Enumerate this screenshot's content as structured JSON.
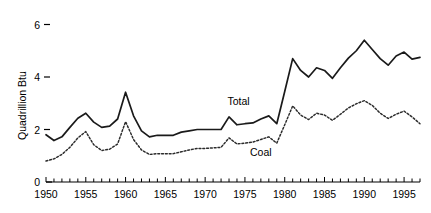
{
  "chart_data": {
    "type": "line",
    "title": "",
    "xlabel": "",
    "ylabel": "Quadrillion Btu",
    "xlim": [
      1950,
      1997
    ],
    "ylim": [
      0,
      6.4
    ],
    "grid": false,
    "legend": "inline-labels",
    "y_ticks": [
      0,
      2,
      4,
      6
    ],
    "y_tick_labels": [
      "0",
      "2",
      "4",
      "6"
    ],
    "x_ticks": [
      1950,
      1951,
      1952,
      1953,
      1954,
      1955,
      1956,
      1957,
      1958,
      1959,
      1960,
      1961,
      1962,
      1963,
      1964,
      1965,
      1966,
      1967,
      1968,
      1969,
      1970,
      1971,
      1972,
      1973,
      1974,
      1975,
      1976,
      1977,
      1978,
      1979,
      1980,
      1981,
      1982,
      1983,
      1984,
      1985,
      1986,
      1987,
      1988,
      1989,
      1990,
      1991,
      1992,
      1993,
      1994,
      1995,
      1996,
      1997
    ],
    "x_tick_labels": [
      "1950",
      "1955",
      "1960",
      "1965",
      "1970",
      "1975",
      "1980",
      "1985",
      "1990",
      "1995"
    ],
    "x_labeled_ticks": [
      1950,
      1955,
      1960,
      1965,
      1970,
      1975,
      1980,
      1985,
      1990,
      1995
    ],
    "x": [
      1950,
      1951,
      1952,
      1953,
      1954,
      1955,
      1956,
      1957,
      1958,
      1959,
      1960,
      1961,
      1962,
      1963,
      1964,
      1965,
      1966,
      1967,
      1968,
      1969,
      1970,
      1971,
      1972,
      1973,
      1974,
      1975,
      1976,
      1977,
      1978,
      1979,
      1980,
      1981,
      1982,
      1983,
      1984,
      1985,
      1986,
      1987,
      1988,
      1989,
      1990,
      1991,
      1992,
      1993,
      1994,
      1995,
      1996,
      1997
    ],
    "series": [
      {
        "name": "Total",
        "style": "solid",
        "color": "#1a1a1a",
        "label_year": 1974.2,
        "label_value": 2.95,
        "values": [
          1.8,
          1.58,
          1.72,
          2.08,
          2.43,
          2.62,
          2.28,
          2.08,
          2.13,
          2.4,
          3.42,
          2.52,
          1.95,
          1.72,
          1.78,
          1.78,
          1.78,
          1.9,
          1.95,
          2.0,
          2.0,
          2.0,
          2.0,
          2.48,
          2.18,
          2.22,
          2.25,
          2.4,
          2.52,
          2.22,
          3.45,
          4.7,
          4.25,
          4.0,
          4.35,
          4.25,
          3.95,
          4.35,
          4.72,
          5.0,
          5.4,
          5.05,
          4.7,
          4.45,
          4.8,
          4.95,
          4.68,
          4.75
        ]
      },
      {
        "name": "Coal",
        "style": "dotted",
        "color": "#2b2b2b",
        "label_year": 1977.0,
        "label_value": 1.0,
        "values": [
          0.8,
          0.88,
          1.05,
          1.32,
          1.68,
          1.92,
          1.42,
          1.2,
          1.25,
          1.45,
          2.3,
          1.62,
          1.22,
          1.05,
          1.08,
          1.08,
          1.08,
          1.15,
          1.22,
          1.28,
          1.28,
          1.3,
          1.32,
          1.68,
          1.45,
          1.48,
          1.52,
          1.62,
          1.72,
          1.48,
          2.18,
          2.9,
          2.55,
          2.38,
          2.62,
          2.55,
          2.35,
          2.58,
          2.82,
          2.98,
          3.1,
          2.92,
          2.62,
          2.42,
          2.58,
          2.7,
          2.48,
          2.22
        ]
      }
    ]
  }
}
